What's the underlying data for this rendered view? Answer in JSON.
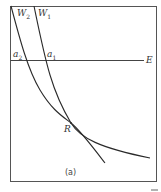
{
  "figure": {
    "caption": "(a)",
    "colors": {
      "stroke": "#2a2a2a",
      "frame": "#555555",
      "background": "#ffffff"
    },
    "axis_label": "E",
    "curves": [
      {
        "id": "W2",
        "label_main": "W",
        "label_sub": "2"
      },
      {
        "id": "W1",
        "label_main": "W",
        "label_sub": "1"
      }
    ],
    "points": [
      {
        "id": "a2",
        "label_main": "a",
        "label_sub": "2"
      },
      {
        "id": "a1",
        "label_main": "a",
        "label_sub": "1"
      },
      {
        "id": "R",
        "label_main": "R"
      }
    ],
    "corner_mark": "—"
  }
}
